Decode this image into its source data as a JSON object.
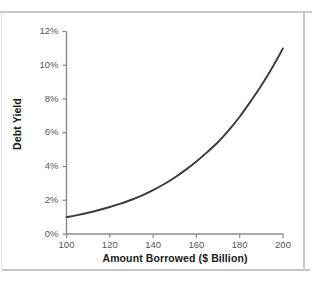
{
  "chart_data": {
    "type": "line",
    "title": "",
    "subtitle": "",
    "xlabel": "Amount Borrowed ($ Billion)",
    "ylabel": "Debt Yield",
    "xlim": [
      100,
      200
    ],
    "ylim": [
      0,
      12
    ],
    "grid": false,
    "legend": null,
    "x_tick_labels": [
      "100",
      "120",
      "140",
      "160",
      "180",
      "200"
    ],
    "x_ticks": [
      100,
      120,
      140,
      160,
      180,
      200
    ],
    "y_tick_labels": [
      "0%",
      "2%",
      "4%",
      "6%",
      "8%",
      "10%",
      "12%"
    ],
    "y_ticks": [
      0,
      2,
      4,
      6,
      8,
      10,
      12
    ],
    "series": [
      {
        "name": "Debt Yield",
        "color": "#3a3a3a",
        "x": [
          100,
          105,
          110,
          115,
          120,
          125,
          130,
          135,
          140,
          145,
          150,
          155,
          160,
          165,
          170,
          175,
          180,
          185,
          190,
          195,
          200
        ],
        "values": [
          1.0,
          1.12,
          1.26,
          1.42,
          1.6,
          1.8,
          2.03,
          2.29,
          2.6,
          2.95,
          3.35,
          3.8,
          4.3,
          4.85,
          5.45,
          6.15,
          6.95,
          7.85,
          8.8,
          9.85,
          11.0
        ]
      }
    ],
    "annotations": []
  },
  "axes": {
    "y_axis_title": "Debt Yield",
    "x_axis_title": "Amount Borrowed ($ Billion)"
  },
  "style": {
    "curve_color": "#3a3a3a",
    "axis_color": "#8a8a8a",
    "tick_text_color": "#555555",
    "title_text_color": "#1a1a1a",
    "frame_color": "#c9c9c9",
    "background": "#ffffff"
  }
}
